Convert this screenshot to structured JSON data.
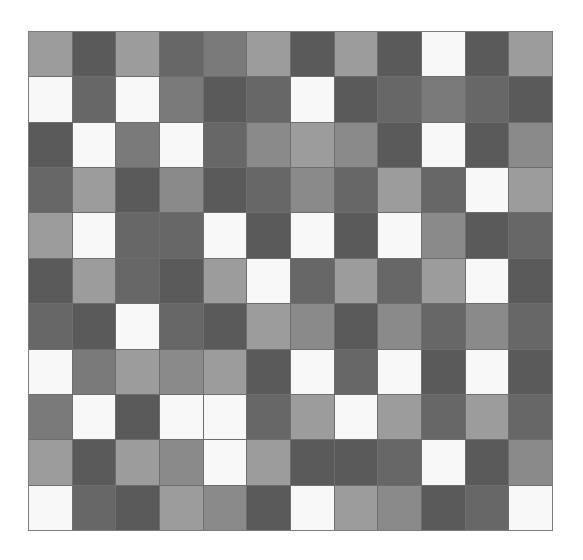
{
  "grid": {
    "rows": 11,
    "cols": 12,
    "palette": {
      "W": "#f8f8f8",
      "L": "#9c9c9c",
      "M8": "#8a8a8a",
      "M7": "#7a7a7a",
      "M6": "#676767",
      "D": "#5a5a5a"
    },
    "cells": [
      [
        "L",
        "D",
        "L",
        "M6",
        "M7",
        "L",
        "D",
        "L",
        "D",
        "W",
        "D",
        "L"
      ],
      [
        "W",
        "M6",
        "W",
        "M7",
        "D",
        "M6",
        "W",
        "D",
        "M6",
        "M7",
        "M6",
        "D"
      ],
      [
        "D",
        "W",
        "M7",
        "W",
        "M6",
        "M8",
        "L",
        "M8",
        "D",
        "W",
        "D",
        "M8"
      ],
      [
        "M6",
        "L",
        "D",
        "M8",
        "D",
        "M6",
        "M8",
        "M6",
        "L",
        "M6",
        "W",
        "L"
      ],
      [
        "L",
        "W",
        "M6",
        "M6",
        "W",
        "D",
        "W",
        "D",
        "W",
        "M8",
        "D",
        "M6"
      ],
      [
        "D",
        "L",
        "M6",
        "D",
        "L",
        "W",
        "M6",
        "L",
        "M6",
        "L",
        "W",
        "D"
      ],
      [
        "M6",
        "D",
        "W",
        "M6",
        "D",
        "L",
        "M8",
        "D",
        "M8",
        "M6",
        "M8",
        "M6"
      ],
      [
        "W",
        "M7",
        "L",
        "M8",
        "L",
        "D",
        "W",
        "M6",
        "W",
        "D",
        "W",
        "D"
      ],
      [
        "M7",
        "W",
        "D",
        "W",
        "W",
        "M6",
        "L",
        "W",
        "L",
        "M6",
        "L",
        "M6"
      ],
      [
        "L",
        "D",
        "L",
        "M8",
        "W",
        "L",
        "D",
        "D",
        "M6",
        "W",
        "D",
        "M8"
      ],
      [
        "W",
        "M6",
        "D",
        "L",
        "M8",
        "D",
        "W",
        "L",
        "M8",
        "D",
        "M6",
        "W"
      ]
    ]
  }
}
